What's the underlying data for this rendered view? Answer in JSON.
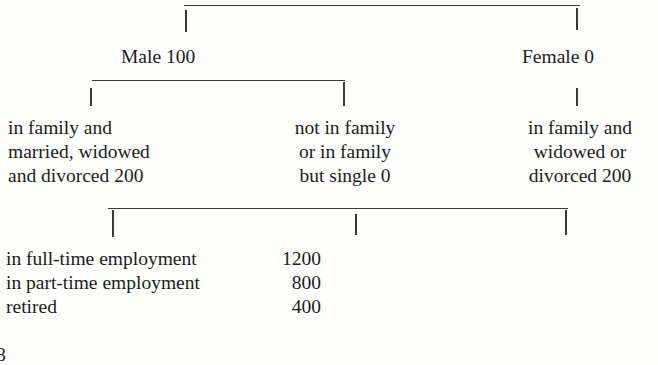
{
  "tree": {
    "level1": {
      "male": {
        "label": "Male",
        "value": "100"
      },
      "female": {
        "label": "Female",
        "value": "0"
      }
    },
    "level2": {
      "male_in_family": {
        "lines": [
          "in family and",
          "married, widowed",
          "and divorced 200"
        ]
      },
      "male_not_in_family": {
        "lines": [
          "not in family",
          "or in family",
          "but single 0"
        ]
      },
      "female_in_family": {
        "lines": [
          "in family and",
          "widowed or",
          "divorced 200"
        ]
      }
    },
    "level3": {
      "items": [
        {
          "label": "in full-time employment",
          "value": "1200"
        },
        {
          "label": "in part-time employment",
          "value": "800"
        },
        {
          "label": "retired",
          "value": "400"
        }
      ]
    }
  },
  "fragment": "8"
}
